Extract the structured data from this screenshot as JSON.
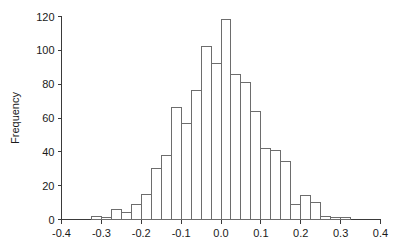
{
  "chart_data": {
    "type": "bar",
    "title": "",
    "subtitle": "",
    "xlabel": "",
    "ylabel": "Frequency",
    "xlim": [
      -0.4,
      0.4
    ],
    "ylim": [
      0,
      120
    ],
    "grid": false,
    "legend": null,
    "bin_width": 0.025,
    "bin_edges": [
      -0.325,
      -0.3,
      -0.275,
      -0.25,
      -0.225,
      -0.2,
      -0.175,
      -0.15,
      -0.125,
      -0.1,
      -0.075,
      -0.05,
      -0.025,
      0.0,
      0.025,
      0.05,
      0.075,
      0.1,
      0.125,
      0.15,
      0.175,
      0.2,
      0.225,
      0.25,
      0.275,
      0.3,
      0.325
    ],
    "categories": [
      "-0.325",
      "-0.300",
      "-0.275",
      "-0.250",
      "-0.225",
      "-0.200",
      "-0.175",
      "-0.150",
      "-0.125",
      "-0.100",
      "-0.075",
      "-0.050",
      "-0.025",
      "0.000",
      "0.025",
      "0.050",
      "0.075",
      "0.100",
      "0.125",
      "0.150",
      "0.175",
      "0.200",
      "0.225",
      "0.250",
      "0.275",
      "0.300"
    ],
    "values": [
      2,
      1,
      6,
      4,
      9,
      15,
      30,
      38,
      66,
      57,
      76,
      102,
      92,
      118,
      86,
      81,
      64,
      42,
      41,
      34,
      9,
      14,
      10,
      2,
      1,
      1
    ],
    "xticks": [
      -0.4,
      -0.3,
      -0.2,
      -0.1,
      0.0,
      0.1,
      0.2,
      0.3,
      0.4
    ],
    "xtick_labels": [
      "-0.4",
      "-0.3",
      "-0.2",
      "-0.1",
      "0.0",
      "0.1",
      "0.2",
      "0.3",
      "0.4"
    ],
    "yticks": [
      0,
      20,
      40,
      60,
      80,
      100,
      120
    ],
    "ytick_labels": [
      "0",
      "20",
      "40",
      "60",
      "80",
      "100",
      "120"
    ],
    "colors": {
      "bar_stroke": "#6d6d6d",
      "bar_fill": "none",
      "axis": "#3a3a3a",
      "text": "#1a1a1a",
      "background": "#ffffff"
    }
  }
}
